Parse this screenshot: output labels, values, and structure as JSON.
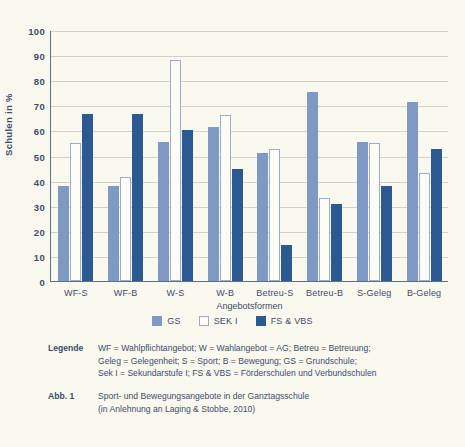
{
  "chart_data": {
    "type": "bar",
    "title": "",
    "xlabel": "Angebotsformen",
    "ylabel": "Schulen in %",
    "ylim": [
      0,
      100
    ],
    "ytick_step": 10,
    "grid": true,
    "legend_position": "bottom-center",
    "yticks": [
      "100",
      "90",
      "80",
      "70",
      "60",
      "50",
      "40",
      "30",
      "20",
      "10",
      "0"
    ],
    "categories": [
      "WF-S",
      "WF-B",
      "W-S",
      "W-B",
      "Betreu-S",
      "Betreu-B",
      "S-Geleg",
      "B-Geleg"
    ],
    "series": [
      {
        "name": "GS",
        "color": "#7d99c4",
        "values": [
          38,
          38,
          55.5,
          61.5,
          51,
          75.5,
          55.5,
          71.5
        ]
      },
      {
        "name": "SEK I",
        "color": "#fdfcf6",
        "values": [
          55,
          41.5,
          88,
          66,
          52.5,
          33,
          55,
          43
        ]
      },
      {
        "name": "FS & VBS",
        "color": "#2b5a92",
        "values": [
          66.5,
          66.5,
          60,
          44.5,
          14.5,
          30.5,
          38,
          52.5
        ]
      }
    ]
  },
  "footnotes": [
    {
      "key": "Legende",
      "text": "WF = Wahlpflichtangebot; W = Wahlangebot = AG; Betreu = Betreuung;\nGeleg = Gelegenheit; S = Sport; B = Bewegung; GS = Grundschule;\nSek I = Sekundarstufe I; FS & VBS = Förderschulen und Verbundschulen"
    },
    {
      "key": "Abb. 1",
      "text": "Sport- und Bewegungsangebote in der Ganztagsschule\n(in Anlehnung an Laging & Stobbe, 2010)"
    }
  ]
}
